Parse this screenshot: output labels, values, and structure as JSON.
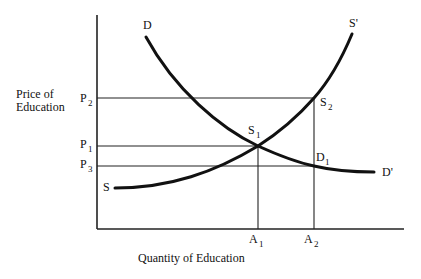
{
  "diagram": {
    "axes": {
      "y_label_line1": "Price of",
      "y_label_line2": "Education",
      "x_label": "Quantity of Education"
    },
    "price_levels": [
      {
        "name": "P",
        "sub": "2"
      },
      {
        "name": "P",
        "sub": "1"
      },
      {
        "name": "P",
        "sub": "3"
      }
    ],
    "quantity_levels": [
      {
        "name": "A",
        "sub": "1"
      },
      {
        "name": "A",
        "sub": "2"
      }
    ],
    "curves": {
      "demand_start": "D",
      "demand_end": "D'",
      "supply_start": "S",
      "supply_end": "S'"
    },
    "points": [
      {
        "name": "S",
        "sub": "1",
        "description": "Equilibrium at P1, A1"
      },
      {
        "name": "S",
        "sub": "2",
        "description": "Supply at P2, A2"
      },
      {
        "name": "D",
        "sub": "1",
        "description": "Demand at P3, A2"
      }
    ],
    "colors": {
      "line": "#111111",
      "background": "#ffffff"
    }
  }
}
